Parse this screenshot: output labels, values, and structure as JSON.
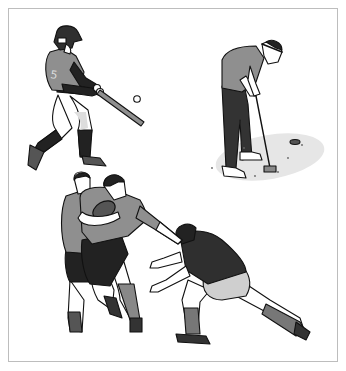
{
  "figure": {
    "panels": [
      {
        "sport": "baseball",
        "subject": "batter swinging at ball",
        "jersey_number": "5"
      },
      {
        "sport": "golf",
        "subject": "golfer putting on green"
      },
      {
        "sport": "rugby",
        "subject": "ball carrier with teammate being tackled"
      }
    ]
  },
  "colors": {
    "outline": "#111111",
    "jersey_gray": "#8f8f8f",
    "dark": "#2f2f2f",
    "light_gray": "#cfcfcf",
    "green_shadow": "#e6e6e6",
    "frame": "#bdbdbd"
  }
}
